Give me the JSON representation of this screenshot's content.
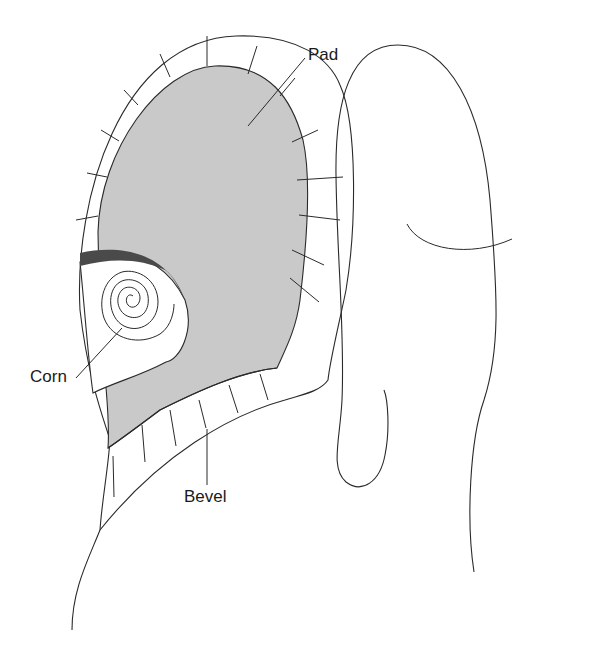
{
  "diagram": {
    "title": "",
    "labels": {
      "pad": "Pad",
      "corn": "Corn",
      "bevel": "Bevel"
    },
    "colors": {
      "pad_fill": "#c9c9c9",
      "corn_rim": "#4a4a4a",
      "line": "#2a2a2a",
      "background": "#ffffff"
    },
    "elements": [
      {
        "name": "bevel",
        "description": "segmented white rim surrounding the pad"
      },
      {
        "name": "pad",
        "description": "gray stippled central pad"
      },
      {
        "name": "corn",
        "description": "spiral marking within a cut-out aperture on the left side"
      },
      {
        "name": "adjacent-toe",
        "description": "outline of neighbouring toe with nail-fold curve"
      }
    ]
  }
}
